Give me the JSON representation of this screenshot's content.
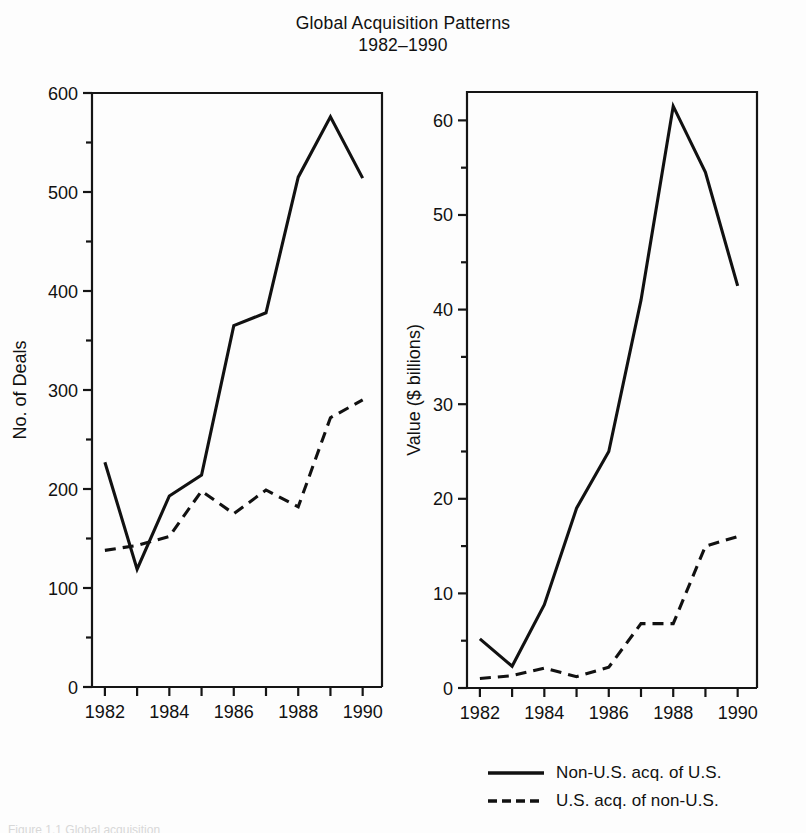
{
  "title": {
    "line1": "Global Acquisition Patterns",
    "line2": "1982–1990"
  },
  "legend": {
    "items": [
      {
        "label": "Non-U.S. acq. of U.S.",
        "style": "solid",
        "color": "#111111"
      },
      {
        "label": "U.S. acq. of non-U.S.",
        "style": "dashed",
        "color": "#111111"
      }
    ]
  },
  "bottom_caption": "Figure 1.1  Global acquisition",
  "chart_data": [
    {
      "id": "deals",
      "type": "line",
      "title": "",
      "xlabel": "Year",
      "ylabel": "No. of Deals",
      "x": [
        1982,
        1983,
        1984,
        1985,
        1986,
        1987,
        1988,
        1989,
        1990
      ],
      "xticklabels": [
        "1982",
        "",
        "1984",
        "",
        "1986",
        "",
        "1988",
        "",
        "1990"
      ],
      "xlim": [
        1981.6,
        1990.6
      ],
      "yticks": [
        0,
        100,
        200,
        300,
        400,
        500,
        600
      ],
      "yticklabels": [
        "0",
        "100",
        "200",
        "300",
        "400",
        "500",
        "600"
      ],
      "yminorticks": [
        50,
        150,
        250,
        350,
        450,
        550
      ],
      "ylim": [
        0,
        600
      ],
      "grid": false,
      "legend_position": "below-right",
      "series": [
        {
          "name": "Non-U.S. acq. of U.S.",
          "style": "solid",
          "color": "#111111",
          "values": [
            227,
            119,
            193,
            214,
            365,
            378,
            515,
            576,
            514
          ]
        },
        {
          "name": "U.S. acq. of non-U.S.",
          "style": "dashed",
          "color": "#111111",
          "values": [
            138,
            143,
            152,
            198,
            175,
            199,
            182,
            272,
            290
          ]
        }
      ]
    },
    {
      "id": "value",
      "type": "line",
      "title": "",
      "xlabel": "Year",
      "ylabel": "Value ($ billions)",
      "x": [
        1982,
        1983,
        1984,
        1985,
        1986,
        1987,
        1988,
        1989,
        1990
      ],
      "xticklabels": [
        "1982",
        "",
        "1984",
        "",
        "1986",
        "",
        "1988",
        "",
        "1990"
      ],
      "xlim": [
        1981.6,
        1990.6
      ],
      "yticks": [
        0,
        10,
        20,
        30,
        40,
        50,
        60
      ],
      "yticklabels": [
        "0",
        "10",
        "20",
        "30",
        "40",
        "50",
        "60"
      ],
      "yminorticks": [
        5,
        15,
        25,
        35,
        45,
        55
      ],
      "ylim": [
        0,
        63
      ],
      "grid": false,
      "legend_position": "below",
      "series": [
        {
          "name": "Non-U.S. acq. of U.S.",
          "style": "solid",
          "color": "#111111",
          "values": [
            5.2,
            2.3,
            8.8,
            19.0,
            25.0,
            41.0,
            61.5,
            54.5,
            42.5
          ]
        },
        {
          "name": "U.S. acq. of non-U.S.",
          "style": "dashed",
          "color": "#111111",
          "values": [
            1.0,
            1.3,
            2.1,
            1.2,
            2.2,
            6.8,
            6.8,
            15.0,
            16.0
          ]
        }
      ]
    }
  ]
}
